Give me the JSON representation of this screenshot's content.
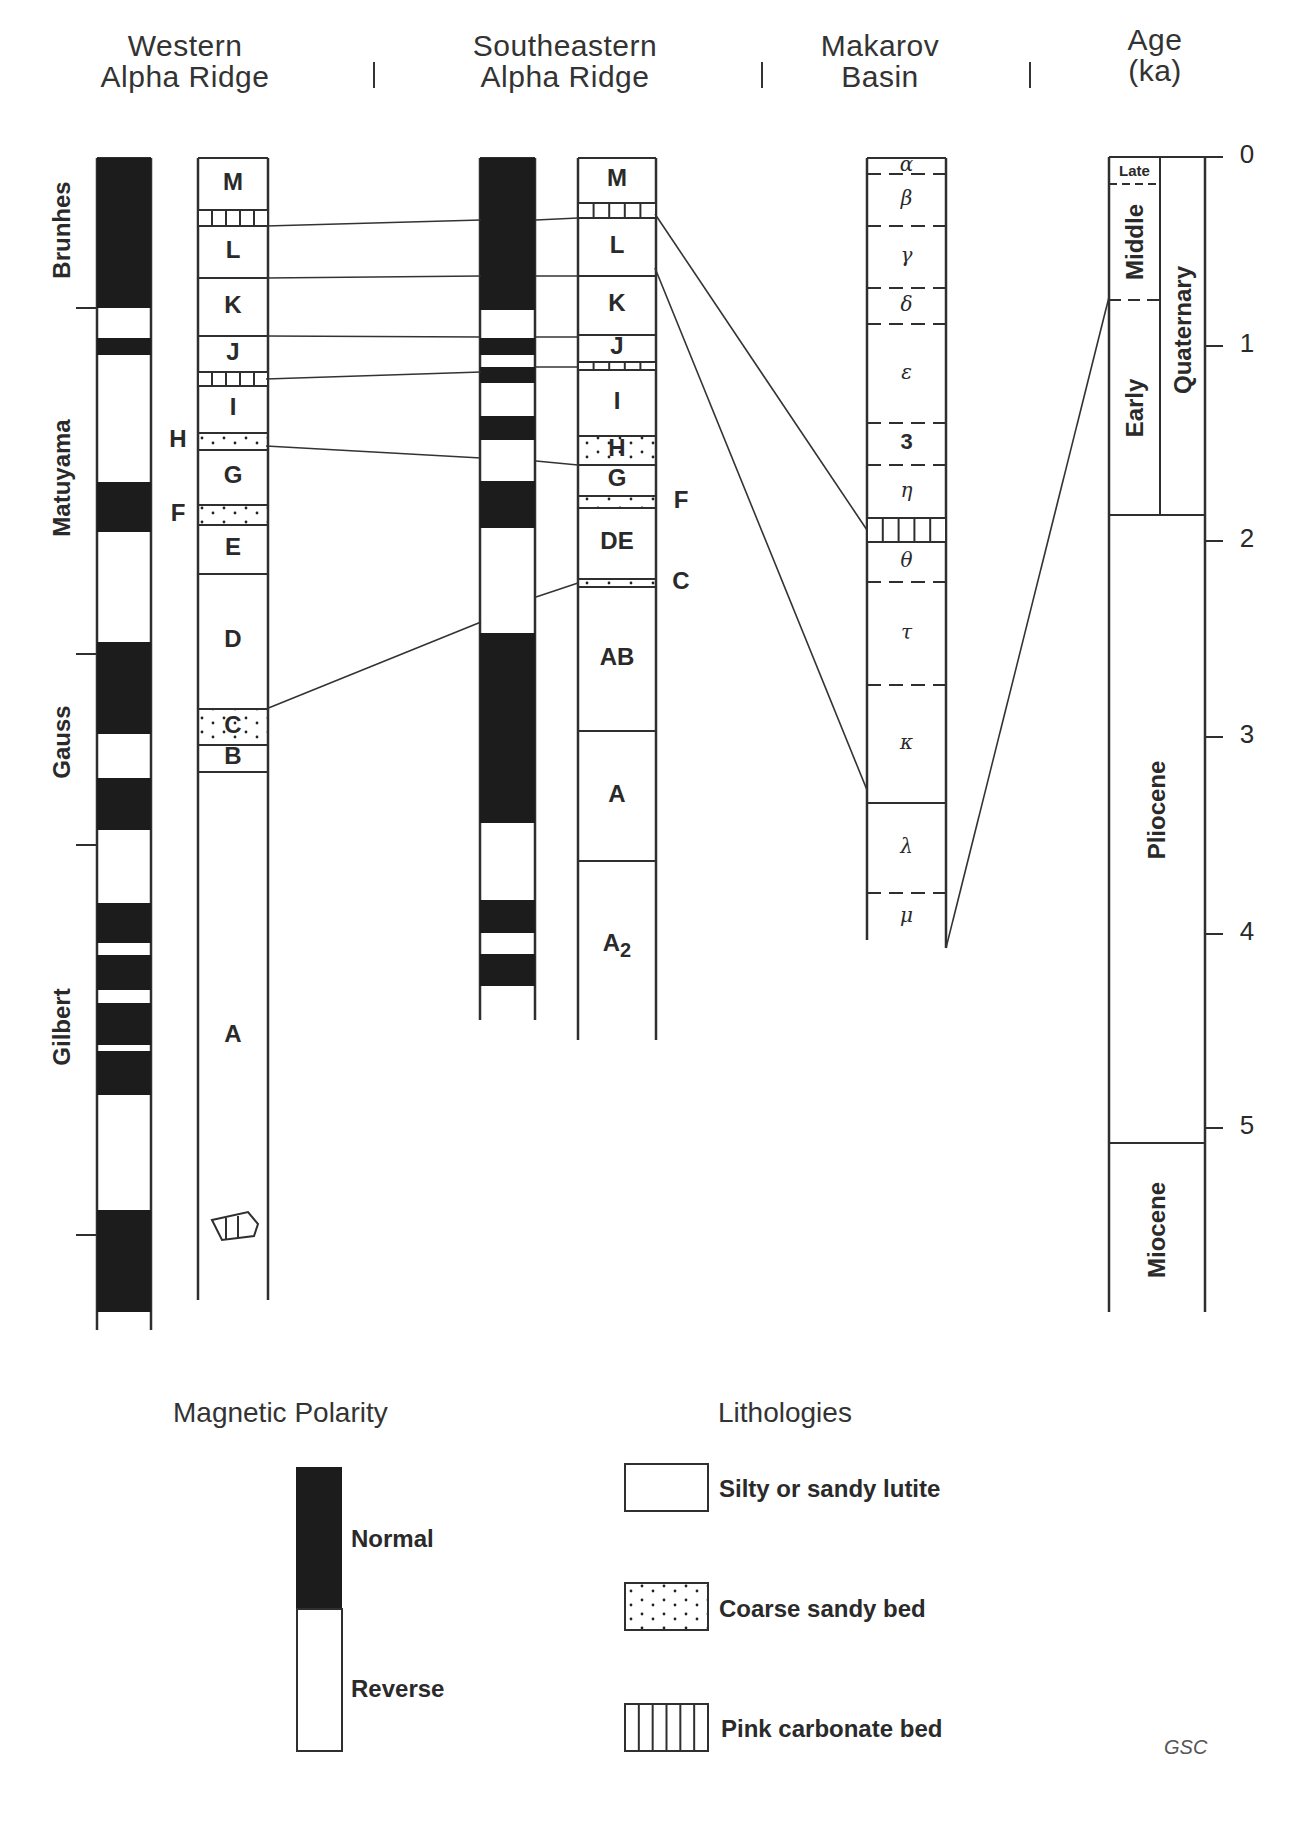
{
  "headers": {
    "western": [
      "Western",
      "Alpha Ridge"
    ],
    "southeastern": [
      "Southeastern",
      "Alpha Ridge"
    ],
    "makarov": [
      "Makarov",
      "Basin"
    ],
    "age": [
      "Age",
      "(ka)"
    ]
  },
  "chronozones": [
    "Brunhes",
    "Matuyama",
    "Gauss",
    "Gilbert"
  ],
  "western_polarity_normal_bands": [
    [
      158,
      308
    ],
    [
      338,
      355
    ],
    [
      482,
      532
    ],
    [
      642,
      734
    ],
    [
      778,
      830
    ],
    [
      903,
      943
    ],
    [
      955,
      990
    ],
    [
      1003,
      1045
    ],
    [
      1051,
      1095
    ],
    [
      1210,
      1312
    ]
  ],
  "western_units": [
    {
      "label": "M",
      "top": 158,
      "bottom": 210,
      "type": "lutite"
    },
    {
      "label": "",
      "top": 210,
      "bottom": 226,
      "type": "carbonate"
    },
    {
      "label": "L",
      "top": 226,
      "bottom": 278,
      "type": "lutite"
    },
    {
      "label": "K",
      "top": 278,
      "bottom": 336,
      "type": "lutite"
    },
    {
      "label": "J",
      "top": 336,
      "bottom": 372,
      "type": "lutite"
    },
    {
      "label": "",
      "top": 372,
      "bottom": 386,
      "type": "carbonate"
    },
    {
      "label": "I",
      "top": 386,
      "bottom": 433,
      "type": "lutite"
    },
    {
      "label": "",
      "top": 433,
      "bottom": 450,
      "type": "sand",
      "side_label": "H"
    },
    {
      "label": "G",
      "top": 450,
      "bottom": 505,
      "type": "lutite"
    },
    {
      "label": "",
      "top": 505,
      "bottom": 525,
      "type": "sand",
      "side_label": "F"
    },
    {
      "label": "E",
      "top": 525,
      "bottom": 574,
      "type": "lutite"
    },
    {
      "label": "D",
      "top": 574,
      "bottom": 709,
      "type": "lutite"
    },
    {
      "label": "C",
      "top": 709,
      "bottom": 745,
      "type": "sand"
    },
    {
      "label": "B",
      "top": 745,
      "bottom": 772,
      "type": "lutite"
    },
    {
      "label": "A",
      "top": 772,
      "bottom": 1300,
      "type": "lutite"
    }
  ],
  "southeastern_polarity_normal_bands": [
    [
      158,
      310
    ],
    [
      338,
      355
    ],
    [
      367,
      383
    ],
    [
      416,
      440
    ],
    [
      481,
      528
    ],
    [
      633,
      823
    ],
    [
      900,
      933
    ],
    [
      954,
      986
    ]
  ],
  "southeastern_units": [
    {
      "label": "M",
      "top": 158,
      "bottom": 203,
      "type": "lutite"
    },
    {
      "label": "",
      "top": 203,
      "bottom": 218,
      "type": "carbonate"
    },
    {
      "label": "L",
      "top": 218,
      "bottom": 276,
      "type": "lutite"
    },
    {
      "label": "K",
      "top": 276,
      "bottom": 335,
      "type": "lutite"
    },
    {
      "label": "J",
      "top": 335,
      "bottom": 362,
      "type": "lutite"
    },
    {
      "label": "",
      "top": 362,
      "bottom": 370,
      "type": "carbonate"
    },
    {
      "label": "I",
      "top": 370,
      "bottom": 436,
      "type": "lutite"
    },
    {
      "label": "H",
      "top": 436,
      "bottom": 465,
      "type": "sand"
    },
    {
      "label": "G",
      "top": 465,
      "bottom": 496,
      "type": "lutite"
    },
    {
      "label": "",
      "top": 496,
      "bottom": 508,
      "type": "sand",
      "side_label": "F"
    },
    {
      "label": "DE",
      "top": 508,
      "bottom": 579,
      "type": "lutite"
    },
    {
      "label": "",
      "top": 579,
      "bottom": 587,
      "type": "sand",
      "side_label": "C"
    },
    {
      "label": "AB",
      "top": 587,
      "bottom": 731,
      "type": "lutite"
    },
    {
      "label": "A",
      "top": 731,
      "bottom": 861,
      "type": "lutite"
    },
    {
      "label": "A",
      "sub": "2",
      "top": 861,
      "bottom": 1030,
      "type": "lutite"
    }
  ],
  "makarov_units": [
    {
      "label": "α",
      "top": 158,
      "bottom": 174,
      "lower_boundary": "dashed"
    },
    {
      "label": "β",
      "top": 174,
      "bottom": 226,
      "lower_boundary": "dashed"
    },
    {
      "label": "γ",
      "top": 226,
      "bottom": 288,
      "lower_boundary": "dashed"
    },
    {
      "label": "δ",
      "top": 288,
      "bottom": 324,
      "lower_boundary": "dashed"
    },
    {
      "label": "ε",
      "top": 324,
      "bottom": 423,
      "lower_boundary": "dashed"
    },
    {
      "label": "3",
      "top": 423,
      "bottom": 465,
      "lower_boundary": "dashed"
    },
    {
      "label": "η",
      "top": 465,
      "bottom": 518,
      "lower_boundary": "solid"
    },
    {
      "label": "",
      "top": 518,
      "bottom": 542,
      "type": "carbonate",
      "lower_boundary": "solid"
    },
    {
      "label": "θ",
      "top": 542,
      "bottom": 582,
      "lower_boundary": "dashed"
    },
    {
      "label": "τ",
      "top": 582,
      "bottom": 685,
      "lower_boundary": "dashed"
    },
    {
      "label": "κ",
      "top": 685,
      "bottom": 803,
      "lower_boundary": "solid"
    },
    {
      "label": "λ",
      "top": 803,
      "bottom": 893,
      "lower_boundary": "dashed"
    },
    {
      "label": "μ",
      "top": 893,
      "bottom": 940,
      "lower_boundary": "none"
    }
  ],
  "age_scale": {
    "ticks": [
      "0",
      "1",
      "2",
      "3",
      "4",
      "5"
    ],
    "tick_y": [
      157,
      346,
      541,
      737,
      934,
      1128
    ],
    "subdivisions": [
      {
        "label": "Late",
        "top": 157,
        "bottom": 184
      },
      {
        "label": "Middle",
        "top": 184,
        "bottom": 300
      },
      {
        "label": "Early",
        "top": 300,
        "bottom": 515
      }
    ],
    "periods": [
      {
        "label": "Quaternary",
        "top": 157,
        "bottom": 515
      },
      {
        "label": "Pliocene",
        "top": 515,
        "bottom": 1143
      },
      {
        "label": "Miocene",
        "top": 1143,
        "bottom": 1312
      }
    ]
  },
  "legend": {
    "polarity_title": "Magnetic Polarity",
    "normal_label": "Normal",
    "reverse_label": "Reverse",
    "lithology_title": "Lithologies",
    "items": [
      {
        "label": "Silty or sandy lutite",
        "pattern": "lutite"
      },
      {
        "label": "Coarse sandy bed",
        "pattern": "sand"
      },
      {
        "label": "Pink carbonate bed",
        "pattern": "carbonate"
      }
    ],
    "credit": "GSC"
  }
}
